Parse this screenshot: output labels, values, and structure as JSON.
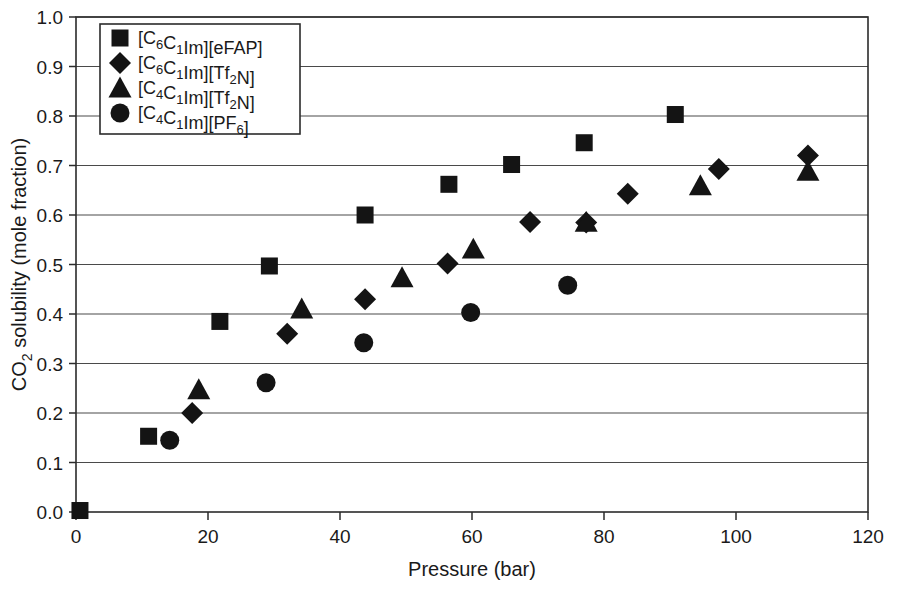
{
  "chart_data": {
    "type": "scatter",
    "title": "",
    "xlabel": "Pressure (bar)",
    "ylabel": "CO2 solubility (mole fraction)",
    "ylabel_parts": {
      "prefix": "CO",
      "sub": "2",
      "suffix": " solubility (mole fraction)"
    },
    "xlim": [
      0,
      120
    ],
    "ylim": [
      0,
      1.0
    ],
    "xticks": [
      0,
      20,
      40,
      60,
      80,
      100,
      120
    ],
    "xtick_labels": [
      "0",
      "20",
      "40",
      "60",
      "80",
      "100",
      "120"
    ],
    "yticks": [
      0.0,
      0.1,
      0.2,
      0.3,
      0.4,
      0.5,
      0.6,
      0.7,
      0.8,
      0.9,
      1.0
    ],
    "ytick_labels": [
      "0.0",
      "0.1",
      "0.2",
      "0.3",
      "0.4",
      "0.5",
      "0.6",
      "0.7",
      "0.8",
      "0.9",
      "1.0"
    ],
    "grid": "horizontal",
    "legend_position": "top-left",
    "marker_color": "#141414",
    "series": [
      {
        "name": "[C6C1Im][eFAP]",
        "marker": "square",
        "label_parts": [
          {
            "t": "[C",
            "sub": false
          },
          {
            "t": "6",
            "sub": true
          },
          {
            "t": "C",
            "sub": false
          },
          {
            "t": "1",
            "sub": true
          },
          {
            "t": "Im][eFAP]",
            "sub": false
          }
        ],
        "points": [
          {
            "x": 0.6,
            "y": 0.003
          },
          {
            "x": 11.0,
            "y": 0.153
          },
          {
            "x": 21.8,
            "y": 0.385
          },
          {
            "x": 29.3,
            "y": 0.497
          },
          {
            "x": 43.8,
            "y": 0.6
          },
          {
            "x": 56.5,
            "y": 0.662
          },
          {
            "x": 66.0,
            "y": 0.702
          },
          {
            "x": 77.0,
            "y": 0.746
          },
          {
            "x": 90.8,
            "y": 0.803
          }
        ]
      },
      {
        "name": "[C6C1Im][Tf2N]",
        "marker": "diamond",
        "label_parts": [
          {
            "t": "[C",
            "sub": false
          },
          {
            "t": "6",
            "sub": true
          },
          {
            "t": "C",
            "sub": false
          },
          {
            "t": "1",
            "sub": true
          },
          {
            "t": "Im][Tf",
            "sub": false
          },
          {
            "t": "2",
            "sub": true
          },
          {
            "t": "N]",
            "sub": false
          }
        ],
        "points": [
          {
            "x": 17.6,
            "y": 0.2
          },
          {
            "x": 32.0,
            "y": 0.36
          },
          {
            "x": 43.8,
            "y": 0.43
          },
          {
            "x": 56.3,
            "y": 0.502
          },
          {
            "x": 68.8,
            "y": 0.586
          },
          {
            "x": 77.3,
            "y": 0.585
          },
          {
            "x": 83.6,
            "y": 0.643
          },
          {
            "x": 97.4,
            "y": 0.693
          },
          {
            "x": 110.9,
            "y": 0.72
          }
        ]
      },
      {
        "name": "[C4C1Im][Tf2N]",
        "marker": "triangle",
        "label_parts": [
          {
            "t": "[C",
            "sub": false
          },
          {
            "t": "4",
            "sub": true
          },
          {
            "t": "C",
            "sub": false
          },
          {
            "t": "1",
            "sub": true
          },
          {
            "t": "Im][Tf",
            "sub": false
          },
          {
            "t": "2",
            "sub": true
          },
          {
            "t": "N]",
            "sub": false
          }
        ],
        "points": [
          {
            "x": 18.6,
            "y": 0.247
          },
          {
            "x": 34.2,
            "y": 0.41
          },
          {
            "x": 49.4,
            "y": 0.473
          },
          {
            "x": 60.2,
            "y": 0.531
          },
          {
            "x": 77.3,
            "y": 0.585
          },
          {
            "x": 94.6,
            "y": 0.659
          },
          {
            "x": 110.9,
            "y": 0.688
          }
        ]
      },
      {
        "name": "[C4C1Im][PF6]",
        "marker": "circle",
        "label_parts": [
          {
            "t": "[C",
            "sub": false
          },
          {
            "t": "4",
            "sub": true
          },
          {
            "t": "C",
            "sub": false
          },
          {
            "t": "1",
            "sub": true
          },
          {
            "t": "Im][PF",
            "sub": false
          },
          {
            "t": "6",
            "sub": true
          },
          {
            "t": "]",
            "sub": false
          }
        ],
        "points": [
          {
            "x": 14.2,
            "y": 0.145
          },
          {
            "x": 28.8,
            "y": 0.261
          },
          {
            "x": 43.6,
            "y": 0.342
          },
          {
            "x": 59.8,
            "y": 0.403
          },
          {
            "x": 74.5,
            "y": 0.458
          }
        ]
      }
    ]
  }
}
